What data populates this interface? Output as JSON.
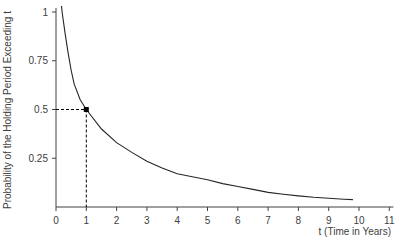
{
  "chart_data": {
    "type": "line",
    "title": "",
    "xlabel": "t (Time in Years)",
    "ylabel": "Probability of the Holding Period Exceeding t",
    "xlim": [
      0,
      11
    ],
    "ylim": [
      0,
      1
    ],
    "x_ticks": [
      0,
      1,
      2,
      3,
      4,
      5,
      6,
      7,
      8,
      9,
      10,
      11
    ],
    "y_ticks": [
      0.25,
      0.5,
      0.75,
      1
    ],
    "y_tick_labels": [
      "0.25",
      "0.5",
      "0.75",
      "1"
    ],
    "grid": false,
    "legend": null,
    "series": [
      {
        "name": "P(holding period > t)",
        "x": [
          0.2,
          0.3,
          0.4,
          0.5,
          0.6,
          0.8,
          1.0,
          1.5,
          2.0,
          2.5,
          3.0,
          3.5,
          4.0,
          4.5,
          5.0,
          5.5,
          6.0,
          6.5,
          7.0,
          7.5,
          8.0,
          8.5,
          9.0,
          9.5,
          9.8
        ],
        "y": [
          1.0,
          0.89,
          0.79,
          0.7,
          0.63,
          0.55,
          0.5,
          0.4,
          0.33,
          0.28,
          0.235,
          0.2,
          0.17,
          0.155,
          0.14,
          0.12,
          0.105,
          0.09,
          0.075,
          0.065,
          0.057,
          0.05,
          0.045,
          0.04,
          0.038
        ]
      }
    ],
    "annotations": [
      {
        "type": "point",
        "x": 1,
        "y": 0.5,
        "marker": "square"
      },
      {
        "type": "dashed-guide",
        "from": [
          0,
          0.5
        ],
        "to": [
          1,
          0.5
        ]
      },
      {
        "type": "dashed-guide",
        "from": [
          1,
          0.5
        ],
        "to": [
          1,
          0
        ]
      }
    ]
  },
  "style": {
    "axis_color": "#404040",
    "curve_color": "#262626",
    "text_color": "#404040"
  }
}
